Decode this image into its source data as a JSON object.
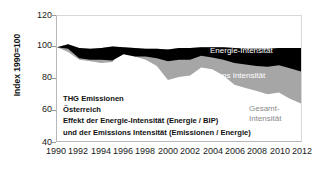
{
  "chart_data": {
    "type": "area",
    "title": "",
    "subtitle": "",
    "xlabel": "",
    "ylabel": "Index 1990=100",
    "xlim": [
      1990,
      2012
    ],
    "ylim": [
      40,
      120
    ],
    "grid": false,
    "stacked": true,
    "legend_position": "inline",
    "x": [
      1990,
      1991,
      1992,
      1993,
      1994,
      1995,
      1996,
      1997,
      1998,
      1999,
      2000,
      2001,
      2002,
      2003,
      2004,
      2005,
      2006,
      2007,
      2008,
      2009,
      2010,
      2011,
      2012
    ],
    "x_ticks": [
      "1990",
      "1992",
      "1994",
      "1996",
      "1998",
      "2000",
      "2002",
      "2004",
      "2006",
      "2008",
      "2010",
      "2012"
    ],
    "y_ticks": [
      "40",
      "60",
      "80",
      "100",
      "120"
    ],
    "series": [
      {
        "name": "THG Emissionen (Oberkante)",
        "role": "top-boundary",
        "color": "#000000",
        "values": [
          100,
          102,
          99.5,
          99,
          99.5,
          100.5,
          100,
          99.5,
          99,
          99,
          98.5,
          99.5,
          99.5,
          100,
          100,
          100,
          99.5,
          99,
          99,
          99,
          99.5,
          99.5,
          99.5
        ]
      },
      {
        "name": "Energie-Intensität",
        "role": "black-band-lower-boundary",
        "color": "#000000",
        "values": [
          100,
          99,
          93,
          92,
          92,
          91.5,
          95.5,
          94,
          94,
          93,
          91,
          92,
          92,
          94.5,
          93.5,
          92,
          90,
          89,
          88,
          87.5,
          88.5,
          86.5,
          84.5
        ]
      },
      {
        "name": "Emissions Intensität",
        "role": "gray-band-lower-boundary",
        "color": "#a6a6a6",
        "values": [
          100,
          98,
          92.5,
          91.5,
          91,
          90.5,
          94.5,
          93,
          92.5,
          91.5,
          89,
          91,
          91,
          94,
          93,
          91,
          88.5,
          87.5,
          86.5,
          86,
          87,
          85,
          83
        ]
      },
      {
        "name": "Gesamt-Intensität",
        "role": "bottom-boundary",
        "color": "#a6a6a6",
        "values": [
          100,
          97,
          92,
          91,
          90,
          90.5,
          100,
          94,
          92,
          88,
          79,
          81,
          82,
          87,
          86,
          82,
          76,
          74,
          72,
          70,
          71,
          67,
          64
        ]
      }
    ],
    "series_labels": [
      {
        "id": "energie",
        "text": "Energie-Intensität"
      },
      {
        "id": "emissions",
        "text": "Emissions Intensität"
      },
      {
        "id": "gesamt_line1",
        "text": "Gesamt-"
      },
      {
        "id": "gesamt_line2",
        "text": "Intensität"
      }
    ],
    "annotation_lines": [
      "THG Emissionen",
      "Österreich",
      "Effekt der Energie-Intensität (Energie / BIP)",
      "und der Emissions Intensität (Emissionen / Energie)"
    ],
    "colors": {
      "band_top": "#000000",
      "band_middle": "#a6a6a6",
      "background": "#ffffff",
      "axis": "#b8b8b8",
      "text": "#1a1a1a",
      "gesamt_label": "#8a8a8a"
    }
  },
  "axis": {
    "y_title": "Index 1990=100",
    "y_ticks": [
      "120",
      "100",
      "80",
      "60",
      "40"
    ],
    "x_ticks": [
      "1990",
      "1992",
      "1994",
      "1996",
      "1998",
      "2000",
      "2002",
      "2004",
      "2006",
      "2008",
      "2010",
      "2012"
    ]
  },
  "labels": {
    "energie": "Energie-Intensität",
    "emissions": "Emissions Intensität",
    "gesamt_1": "Gesamt-",
    "gesamt_2": "Intensität"
  },
  "annotation": {
    "line1": "THG Emissionen",
    "line2": "Österreich",
    "line3": "Effekt der Energie-Intensität (Energie / BIP)",
    "line4": "und der Emissions Intensität (Emissionen / Energie)"
  }
}
